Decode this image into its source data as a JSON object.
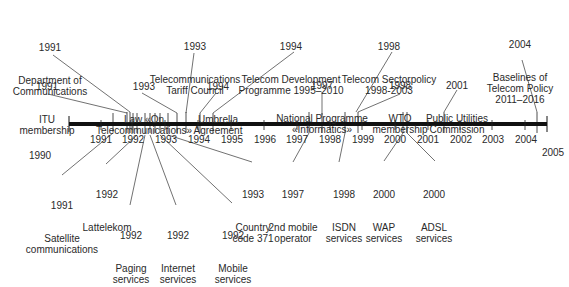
{
  "timeline": {
    "axis": {
      "start_label": "1990",
      "end_label": "2005",
      "color": "#111111"
    },
    "years": [
      {
        "label": "1991",
        "x": 101
      },
      {
        "label": "1992",
        "x": 132
      },
      {
        "label": "1993",
        "x": 165
      },
      {
        "label": "1994",
        "x": 198
      },
      {
        "label": "1995",
        "x": 231
      },
      {
        "label": "1996",
        "x": 264
      },
      {
        "label": "1997",
        "x": 297
      },
      {
        "label": "1998",
        "x": 330
      },
      {
        "label": "1999",
        "x": 362
      },
      {
        "label": "2000",
        "x": 395
      },
      {
        "label": "2001",
        "x": 428
      },
      {
        "label": "2002",
        "x": 460
      },
      {
        "label": "2003",
        "x": 492
      },
      {
        "label": "2004",
        "x": 525
      }
    ],
    "events_above": [
      {
        "year": "1991",
        "text": "Department of\nCommunications"
      },
      {
        "year": "1991",
        "text": "ITU\nmembership"
      },
      {
        "year": "1993",
        "text": "Law «On\nTelecommunications»"
      },
      {
        "year": "1993",
        "text": "Telecommunications\nTariff Council"
      },
      {
        "year": "1994",
        "text": "Umbrella\nAgreement"
      },
      {
        "year": "1994",
        "text": "Telecom Development\nProgramme 1995–2010"
      },
      {
        "year": "1997",
        "text": "National Programme\n«Informatics»"
      },
      {
        "year": "1998",
        "text": "Telecom Sectorpolicy\n1998-2003"
      },
      {
        "year": "1998",
        "text": "WTO\nmembership"
      },
      {
        "year": "2001",
        "text": "Public Utilities\nCommission"
      },
      {
        "year": "2004",
        "text": "Baselines of\nTelecom Policy\n2011–2016"
      }
    ],
    "events_below": [
      {
        "year": "1991",
        "text": "Satellite\ncommunications"
      },
      {
        "year": "1992",
        "text": "Lattelekom"
      },
      {
        "year": "1992",
        "text": "Paging\nservices"
      },
      {
        "year": "1992",
        "text": "Internet\nservices"
      },
      {
        "year": "1992",
        "text": "Mobile\nservices"
      },
      {
        "year": "1993",
        "text": "Country\ncode 371"
      },
      {
        "year": "1997",
        "text": "2nd mobile\noperator"
      },
      {
        "year": "1998",
        "text": "ISDN\nservices"
      },
      {
        "year": "2000",
        "text": "WAP\nservices"
      },
      {
        "year": "2000",
        "text": "ADSL\nservices"
      }
    ]
  }
}
